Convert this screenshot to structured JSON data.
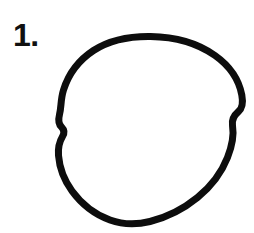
{
  "figure": {
    "label": "1.",
    "caption_text": "1.",
    "shape_name": "circle",
    "shape_description": "hand-drawn circle",
    "stroke_color": "#0d0d0d",
    "background_color": "#ffffff",
    "stroke_width": 7,
    "canvas": {
      "width": 254,
      "height": 233
    },
    "bounds": {
      "left": 58,
      "top": 36,
      "right": 243,
      "bottom": 225
    },
    "center": {
      "x": 150,
      "y": 130
    },
    "radius": {
      "x": 92,
      "y": 94
    },
    "path": "M150.5,36.5 C176,36.8 198,43.5 215,55.5 C229.5,65.8 239,80 241.8,95 C243.4,103.5 242.6,108 238.5,111.5 C233.5,115.8 231.5,119.5 232.5,125.5 C234,134.5 232,146 227.5,157.5 C221.5,172.8 211,186.5 197.5,197.5 C183,209.3 166,217.5 150,221.5 C136,225 122.5,224.5 110,220 C95,214.6 81.5,204 72,191 C64,180 59.5,168 58.5,155.5 C57.9,147.8 59.5,141.5 62.5,136.5 C64.8,132.7 64.5,130 61.5,127 C58.5,124 58,120.5 59.5,114.5 C61.5,106.5 60.5,99.5 63.5,90 C68.5,74 79,60 93.5,50.5 C110,39.8 129.5,36.2 150.5,36.5 Z"
  }
}
